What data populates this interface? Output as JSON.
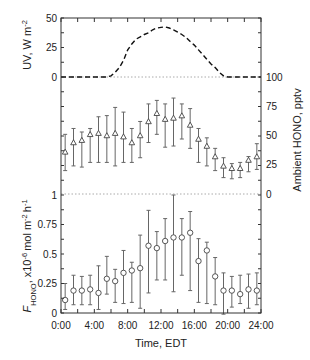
{
  "chart_data": {
    "type": "multi-panel",
    "xlabel": "Time, EDT",
    "xlim": [
      0,
      24
    ],
    "x_tick_hours": [
      0,
      4,
      8,
      12,
      16,
      20,
      24
    ],
    "x_tick_labels": [
      "0:00",
      "4:00",
      "8:00",
      "12:00",
      "16:00",
      "20:00",
      "24:00"
    ],
    "grid": false,
    "legend": null,
    "colors": {
      "frame": "#333333",
      "uv_line": "#111111",
      "errorbar": "#666666",
      "marker_stroke": "#444444",
      "marker_fill": "#ffffff",
      "reference_line": "#aaaaaa"
    },
    "reference_lines": [
      {
        "panel": 0,
        "value": 0
      },
      {
        "panel": 1,
        "value": 0
      }
    ],
    "panels": [
      {
        "name": "UV irradiance",
        "type": "line",
        "style": "dashed",
        "axis": "left",
        "ylabel": {
          "text": "UV, W m",
          "sup": "-2"
        },
        "ylim": [
          0,
          50
        ],
        "y_ticks": [
          0,
          25,
          50
        ],
        "y_tick_labels": [
          "0",
          "25",
          "50"
        ],
        "x": [
          0,
          5.5,
          6,
          6.5,
          7,
          7.5,
          8,
          8.5,
          9,
          9.5,
          10,
          10.5,
          11,
          11.5,
          12,
          12.5,
          13,
          13.5,
          14,
          14.5,
          15,
          15.5,
          16,
          16.5,
          17,
          17.5,
          18,
          18.5,
          19,
          19.5,
          20,
          24
        ],
        "y": [
          0,
          0,
          1,
          4,
          8,
          14,
          23,
          28,
          32,
          34,
          36,
          37.5,
          40,
          41.5,
          42,
          42.5,
          41.5,
          40,
          38,
          36,
          33.5,
          30,
          27,
          23,
          19,
          15,
          11,
          8,
          4,
          1,
          0,
          0
        ]
      },
      {
        "name": "Ambient HONO",
        "type": "scatter-errorbar",
        "marker": "triangle",
        "axis": "right",
        "ylabel": {
          "text": "Ambient HONO, pptv"
        },
        "ylim": [
          0,
          100
        ],
        "y_ticks": [
          0,
          25,
          50,
          75,
          100
        ],
        "y_tick_labels": [
          "0",
          "25",
          "50",
          "75",
          "100"
        ],
        "x": [
          0.5,
          1.5,
          2.5,
          3.5,
          4.5,
          5.5,
          6.5,
          7.5,
          8.5,
          9.5,
          10.5,
          11.5,
          12.5,
          13.5,
          14.5,
          15.5,
          16.5,
          17.5,
          18.5,
          19.5,
          20.5,
          21.5,
          22.5,
          23.5
        ],
        "y": [
          36,
          44,
          46,
          51,
          52,
          50,
          52,
          49,
          44,
          50,
          62,
          69,
          64,
          65,
          67,
          59,
          47,
          41,
          32,
          24,
          22,
          22,
          29,
          32
        ],
        "y_low": [
          20,
          24,
          23,
          27,
          27,
          27,
          24,
          27,
          27,
          31,
          44,
          51,
          40,
          41,
          47,
          39,
          27,
          24,
          20,
          14,
          13,
          14,
          19,
          21
        ],
        "y_high": [
          51,
          56,
          53,
          56,
          66,
          67,
          74,
          70,
          56,
          62,
          77,
          80,
          77,
          82,
          77,
          73,
          56,
          48,
          39,
          31,
          26,
          27,
          32,
          43
        ]
      },
      {
        "name": "HONO flux",
        "type": "scatter-errorbar",
        "marker": "circle",
        "axis": "left",
        "ylabel": {
          "parts": [
            {
              "t": "F",
              "style": "italic"
            },
            {
              "t": "HONO",
              "style": "sub"
            },
            {
              "t": ", x10",
              "style": "normal"
            },
            {
              "t": "-6",
              "style": "sup"
            },
            {
              "t": "mol m",
              "style": "normal"
            },
            {
              "t": "-2",
              "style": "sup"
            },
            {
              "t": "h",
              "style": "normal"
            },
            {
              "t": "-1",
              "style": "sup"
            }
          ]
        },
        "ylim": [
          0,
          1
        ],
        "y_ticks": [
          0,
          0.25,
          0.5,
          0.75,
          1
        ],
        "y_tick_labels": [
          "0",
          "0.25",
          "0.5",
          "0.75",
          "1"
        ],
        "x": [
          0.5,
          1.5,
          2.5,
          3.5,
          4.5,
          5.5,
          6.5,
          7.5,
          8.5,
          9.5,
          10.5,
          11.5,
          12.5,
          13.5,
          14.5,
          15.5,
          16.5,
          17.5,
          18.5,
          19.5,
          20.5,
          21.5,
          22.5,
          23.5
        ],
        "y": [
          0.11,
          0.19,
          0.19,
          0.2,
          0.17,
          0.29,
          0.27,
          0.34,
          0.36,
          0.38,
          0.57,
          0.55,
          0.61,
          0.64,
          0.64,
          0.68,
          0.44,
          0.53,
          0.31,
          0.19,
          0.19,
          0.16,
          0.2,
          0.19
        ],
        "y_low": [
          0.03,
          0.07,
          0.07,
          0.07,
          0.03,
          0.16,
          0.09,
          0.08,
          0.09,
          0.04,
          0.17,
          0.28,
          0.28,
          0.18,
          0.32,
          0.19,
          0.09,
          0.08,
          0.07,
          -0.01,
          0.05,
          0.08,
          0.04,
          0.07
        ],
        "y_high": [
          0.25,
          0.32,
          0.31,
          0.32,
          0.4,
          0.48,
          0.37,
          0.53,
          0.43,
          0.66,
          0.87,
          0.69,
          0.8,
          1.0,
          0.8,
          0.86,
          0.63,
          0.6,
          0.47,
          0.34,
          0.31,
          0.32,
          0.33,
          0.34
        ]
      }
    ]
  }
}
